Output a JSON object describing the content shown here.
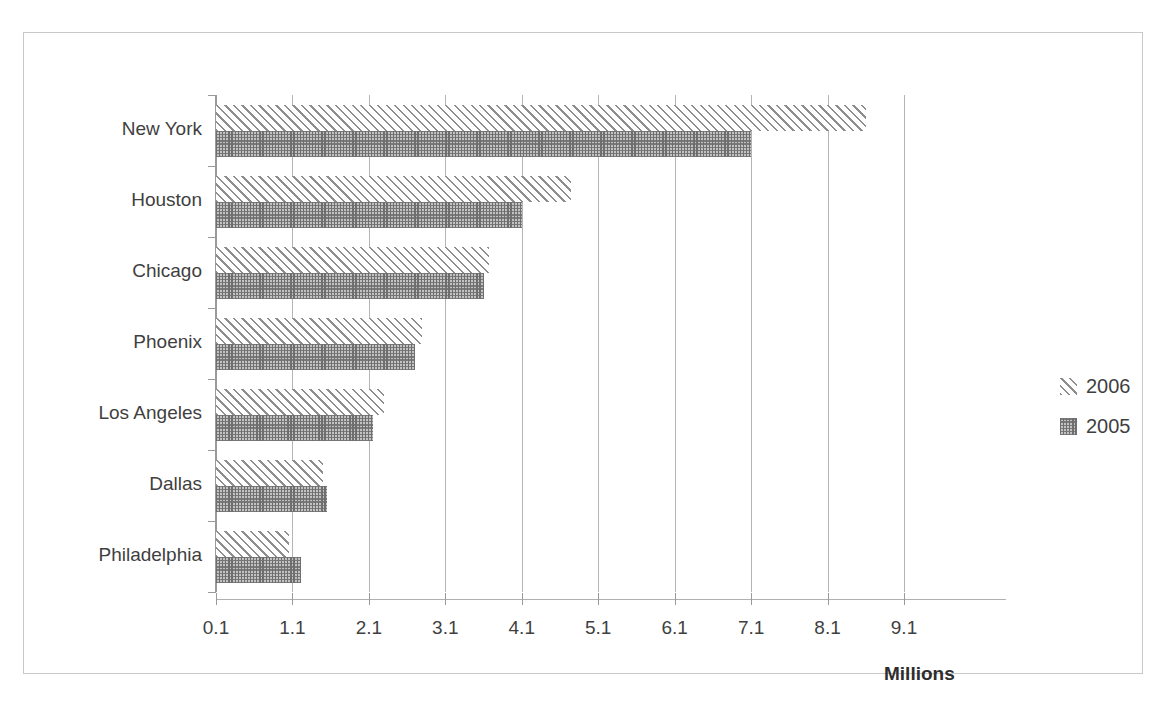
{
  "chart_data": {
    "type": "bar",
    "orientation": "horizontal",
    "title": "",
    "xlabel": "Millions",
    "ylabel": "",
    "categories": [
      "New York",
      "Houston",
      "Chicago",
      "Phoenix",
      "Los Angeles",
      "Dallas",
      "Philadelphia"
    ],
    "series": [
      {
        "name": "2006",
        "values": [
          8.6,
          4.75,
          3.67,
          2.8,
          2.3,
          1.5,
          1.05
        ]
      },
      {
        "name": "2005",
        "values": [
          7.1,
          4.1,
          3.6,
          2.7,
          2.15,
          1.55,
          1.21
        ]
      }
    ],
    "xlim": [
      0.1,
      9.1
    ],
    "xticks": [
      "0.1",
      "1.1",
      "2.1",
      "3.1",
      "4.1",
      "5.1",
      "6.1",
      "7.1",
      "8.1",
      "9.1"
    ],
    "xtick_values": [
      0.1,
      1.1,
      2.1,
      3.1,
      4.1,
      5.1,
      6.1,
      7.1,
      8.1,
      9.1
    ],
    "grid": "vertical",
    "legend_position": "right",
    "colors": {
      "series_2006_fill": "#ffffff",
      "series_2006_hatch": "#8e8e8e",
      "series_2005_fill": "#c2c2c2",
      "series_2005_hatch": "#6e6e6e",
      "gridline": "#b4b4b4",
      "axis": "#9a9a9a",
      "border": "#c9c9c9",
      "text": "#3f3f3f"
    }
  },
  "legend": {
    "entries": [
      {
        "label": "2006",
        "swatch": "diagonal-hatch-swatch"
      },
      {
        "label": "2005",
        "swatch": "crosshatch-swatch"
      }
    ]
  }
}
